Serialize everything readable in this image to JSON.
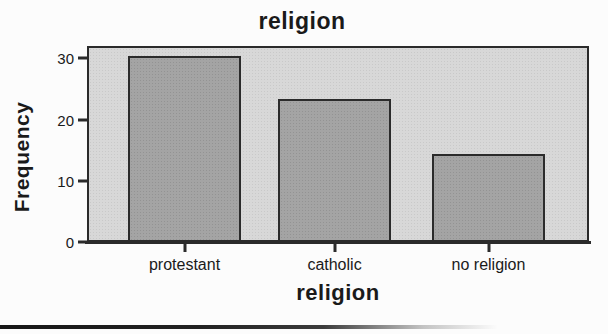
{
  "chart_data": {
    "type": "bar",
    "title": "religion",
    "xlabel": "religion",
    "ylabel": "Frequency",
    "categories": [
      "protestant",
      "catholic",
      "no religion"
    ],
    "values": [
      30,
      23,
      14
    ],
    "yticks": [
      0,
      10,
      20,
      30
    ],
    "ylim": [
      0,
      32
    ],
    "grid": false,
    "legend": "none",
    "colors": {
      "plot_background": "#d8d8d8",
      "bar_fill": "#a4a4a4",
      "axis_and_border": "#2b2b2b",
      "text": "#1a1a1a",
      "page_background": "#fcfcfc"
    }
  }
}
